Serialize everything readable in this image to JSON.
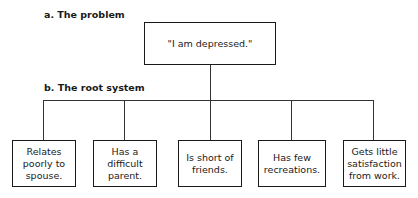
{
  "labels": {
    "problem": "a. The problem",
    "root_system": "b. The root system"
  },
  "problem_box": {
    "text": "\"I am depressed.\""
  },
  "root_boxes": [
    {
      "lines": [
        "Relates",
        "poorly to",
        "spouse."
      ]
    },
    {
      "lines": [
        "Has a",
        "difficult",
        "parent."
      ]
    },
    {
      "lines": [
        "Is short of",
        "friends."
      ]
    },
    {
      "lines": [
        "Has few",
        "recreations."
      ]
    },
    {
      "lines": [
        "Gets little",
        "satisfaction",
        "from work."
      ]
    }
  ]
}
